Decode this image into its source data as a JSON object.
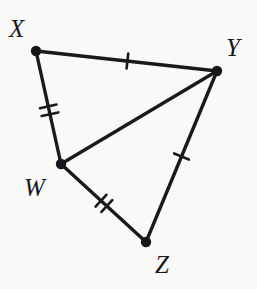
{
  "figure": {
    "kind": "geometry-diagram",
    "width": 257,
    "height": 289,
    "background_color": "#f9f9f7",
    "stroke_color": "#1a1a1c",
    "label_color": "#18181a"
  },
  "vertices": [
    {
      "name": "X",
      "label": "X",
      "x": 36,
      "y": 51,
      "label_x": 9,
      "label_y": 16
    },
    {
      "name": "Y",
      "label": "Y",
      "x": 217,
      "y": 71,
      "label_x": 226,
      "label_y": 35
    },
    {
      "name": "W",
      "label": "W",
      "x": 61,
      "y": 164,
      "label_x": 24,
      "label_y": 175
    },
    {
      "name": "Z",
      "label": "Z",
      "x": 146,
      "y": 242,
      "label_x": 155,
      "label_y": 252
    }
  ],
  "segments": [
    {
      "name": "XY",
      "from": "X",
      "to": "Y",
      "x1": 36,
      "y1": 51,
      "x2": 217,
      "y2": 71,
      "ticks": 1
    },
    {
      "name": "XW",
      "from": "X",
      "to": "W",
      "x1": 36,
      "y1": 51,
      "x2": 61,
      "y2": 164,
      "ticks": 2
    },
    {
      "name": "WY",
      "from": "W",
      "to": "Y",
      "x1": 61,
      "y1": 164,
      "x2": 217,
      "y2": 71,
      "ticks": 0
    },
    {
      "name": "WZ",
      "from": "W",
      "to": "Z",
      "x1": 61,
      "y1": 164,
      "x2": 146,
      "y2": 242,
      "ticks": 2
    },
    {
      "name": "YZ",
      "from": "Y",
      "to": "Z",
      "x1": 217,
      "y1": 71,
      "x2": 146,
      "y2": 242,
      "ticks": 1
    }
  ],
  "tick_marks": [
    {
      "name": "tick-XY",
      "on_segment": "XY",
      "count": 1,
      "t": 0.505,
      "length": 15,
      "spacing": 0
    },
    {
      "name": "tick-XW",
      "on_segment": "XW",
      "count": 2,
      "t": 0.525,
      "length": 17,
      "spacing": 8
    },
    {
      "name": "tick-WZ",
      "on_segment": "WZ",
      "count": 2,
      "t": 0.505,
      "length": 16,
      "spacing": 8
    },
    {
      "name": "tick-YZ",
      "on_segment": "YZ",
      "count": 1,
      "t": 0.5,
      "length": 16,
      "spacing": 0
    }
  ],
  "style": {
    "line_width": 3.4,
    "tick_width": 2.6,
    "vertex_dot_radius": 5.2
  }
}
